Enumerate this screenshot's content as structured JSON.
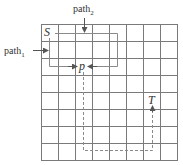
{
  "diagram": {
    "type": "grid-path-diagram",
    "grid": {
      "rows": 8,
      "cols": 8,
      "cell_px": 17,
      "origin": [
        41,
        24
      ],
      "line_color": "#7a7a7a"
    },
    "labels": {
      "start": "S",
      "midpoint": "p",
      "target": "T",
      "path1": {
        "base": "path",
        "sub": "1"
      },
      "path2": {
        "base": "path",
        "sub": "2"
      }
    },
    "paths": [
      {
        "name": "path1",
        "style": "solid",
        "description": "enters from left, runs down along column edge from S, then right to p"
      },
      {
        "name": "path2",
        "style": "solid",
        "description": "enters from top, runs right from S, down, then left to p"
      },
      {
        "name": "p-to-T",
        "style": "dashed",
        "description": "from p straight down, right along bottom row, then up to T"
      }
    ],
    "colors": {
      "path": "#8a8a8a",
      "text": "#333333",
      "background": "#ffffff"
    }
  }
}
